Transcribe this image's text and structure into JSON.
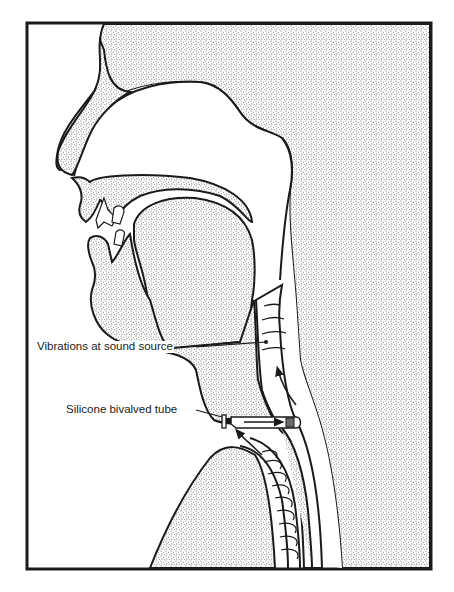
{
  "diagram": {
    "type": "anatomical sagittal cross-section",
    "colors": {
      "ink": "#1a1a1a",
      "paper": "#ffffff",
      "stipple": "#8a8a8a"
    },
    "labels": [
      {
        "id": "vibrations",
        "text": "Vibrations at sound source"
      },
      {
        "id": "tube",
        "text": "Silicone bivalved tube"
      }
    ]
  }
}
